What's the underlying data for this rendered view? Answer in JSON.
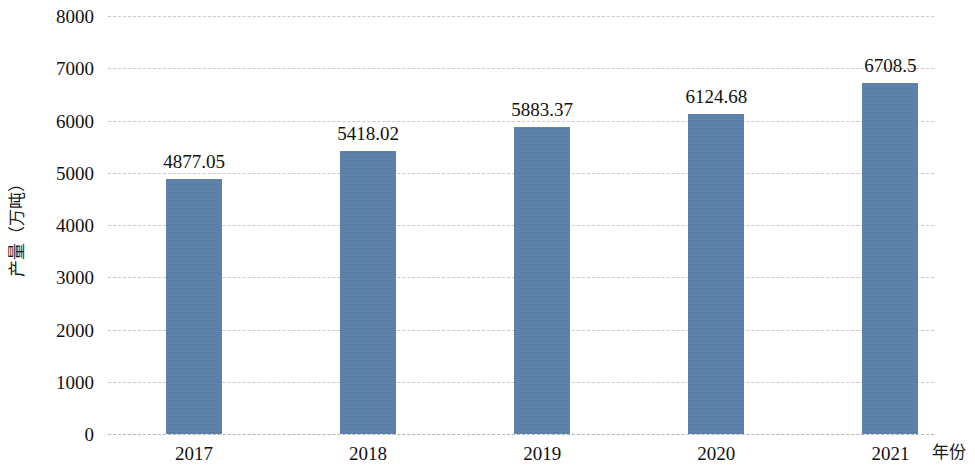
{
  "chart_data": {
    "type": "bar",
    "title": "",
    "xlabel": "年份",
    "ylabel": "产量（万吨）",
    "categories": [
      "2017",
      "2018",
      "2019",
      "2020",
      "2021"
    ],
    "values": [
      4877.05,
      5418.02,
      5883.37,
      6124.68,
      6708.5
    ],
    "value_labels": [
      "4877.05",
      "5418.02",
      "5883.37",
      "6124.68",
      "6708.5"
    ],
    "ylim": [
      0,
      8000
    ],
    "y_ticks": [
      0,
      1000,
      2000,
      3000,
      4000,
      5000,
      6000,
      7000,
      8000
    ],
    "y_tick_labels": [
      "0",
      "1000",
      "2000",
      "3000",
      "4000",
      "5000",
      "6000",
      "7000",
      "8000"
    ],
    "grid": true,
    "grid_axis": "y",
    "grid_style": "dashed",
    "grid_color": "#c9c9c9",
    "legend": null,
    "legend_position": "none",
    "series": [
      {
        "name": "产量",
        "color": "#5a80a8",
        "values": [
          4877.05,
          5418.02,
          5883.37,
          6124.68,
          6708.5
        ]
      }
    ],
    "bar_color": "#5a80a8",
    "data_labels_shown": true,
    "background_color": "#ffffff"
  }
}
